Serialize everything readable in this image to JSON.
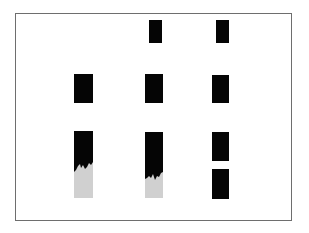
{
  "figure": {
    "frame": {
      "x": 15,
      "y": 13,
      "width": 277,
      "height": 208,
      "stroke": "#6e6e6e"
    },
    "colors": {
      "block": "#050505",
      "fill": "#d0d0d0",
      "background": "#ffffff"
    },
    "rows": [
      {
        "name": "top-row",
        "items": [
          {
            "id": "top-mid",
            "type": "block",
            "x": 149,
            "y": 20,
            "w": 13,
            "h": 23
          },
          {
            "id": "top-right",
            "type": "block",
            "x": 216,
            "y": 20,
            "w": 13,
            "h": 23
          }
        ]
      },
      {
        "name": "middle-row",
        "items": [
          {
            "id": "mid-left",
            "type": "block",
            "x": 74,
            "y": 74,
            "w": 19,
            "h": 29
          },
          {
            "id": "mid-mid",
            "type": "block",
            "x": 145,
            "y": 74,
            "w": 18,
            "h": 29
          },
          {
            "id": "mid-right",
            "type": "block",
            "x": 212,
            "y": 75,
            "w": 17,
            "h": 28
          }
        ]
      },
      {
        "name": "bottom-row",
        "items": [
          {
            "id": "bottom-left",
            "type": "dissolving-bar",
            "x": 74,
            "y": 131,
            "w": 19,
            "h": 67,
            "edge_points": "74,172 76,170 78,166 80,164 81,168 83,165 85,169 87,167 89,163 91,165 93,162"
          },
          {
            "id": "bottom-mid",
            "type": "dissolving-bar",
            "x": 145,
            "y": 132,
            "w": 18,
            "h": 66,
            "edge_points": "145,179 147,178 149,176 151,178 153,174 155,180 157,176 159,177 161,173 163,172"
          },
          {
            "id": "bottom-right-upper",
            "type": "block",
            "x": 212,
            "y": 132,
            "w": 17,
            "h": 29
          },
          {
            "id": "bottom-right-lower",
            "type": "block",
            "x": 212,
            "y": 169,
            "w": 17,
            "h": 30
          }
        ]
      }
    ]
  }
}
